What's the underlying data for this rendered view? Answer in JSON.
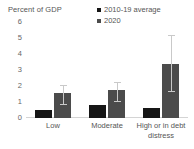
{
  "chart_data": {
    "type": "bar",
    "title": "",
    "ylabel": "Percent of GDP",
    "xlabel": "",
    "ylim": [
      0,
      6
    ],
    "yticks": [
      "0",
      "1",
      "2",
      "3",
      "4",
      "5",
      "6"
    ],
    "grid": false,
    "legend_position": "top-right",
    "categories": [
      "Low",
      "Moderate",
      "High or in debt distress"
    ],
    "series": [
      {
        "name": "2010-19 average",
        "color": "#161616",
        "values": [
          0.5,
          0.8,
          0.65
        ]
      },
      {
        "name": "2020",
        "color": "#4b4b4b",
        "values": [
          1.55,
          1.75,
          3.4
        ],
        "error_low": [
          0.8,
          1.0,
          1.6
        ],
        "error_high": [
          2.0,
          2.2,
          5.1
        ]
      }
    ],
    "error_bar_color": "#c9c9c9"
  },
  "legend": {
    "items": [
      {
        "label": "2010-19 average"
      },
      {
        "label": "2020"
      }
    ]
  },
  "axis": {
    "y_title": "Percent of GDP"
  }
}
